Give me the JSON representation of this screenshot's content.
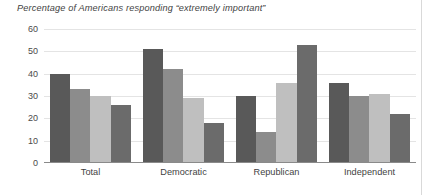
{
  "chart_data": {
    "type": "bar",
    "title": "Percentage of Americans responding “extremely important”",
    "xlabel": "",
    "ylabel": "",
    "ylim": [
      0,
      60
    ],
    "yticks": [
      0,
      10,
      20,
      30,
      40,
      50,
      60
    ],
    "ytick_labels": [
      "0",
      "10",
      "20",
      "30",
      "40",
      "50",
      "60"
    ],
    "grid": true,
    "legend": "none",
    "categories": [
      "Total",
      "Democratic",
      "Republican",
      "Independent"
    ],
    "series": [
      {
        "name": "Series 1",
        "color": "#595959",
        "values": [
          40,
          51,
          30,
          36
        ]
      },
      {
        "name": "Series 2",
        "color": "#8c8c8c",
        "values": [
          33,
          42,
          14,
          30
        ]
      },
      {
        "name": "Series 3",
        "color": "#bfbfbf",
        "values": [
          30,
          29,
          36,
          31
        ]
      },
      {
        "name": "Series 4",
        "color": "#6b6b6b",
        "values": [
          26,
          18,
          53,
          22
        ]
      }
    ]
  },
  "style": {
    "gridline_color": "#e4e4e4",
    "axis_color": "#8a8a8a",
    "text_color": "#3f3f3f",
    "background": "#ffffff"
  }
}
